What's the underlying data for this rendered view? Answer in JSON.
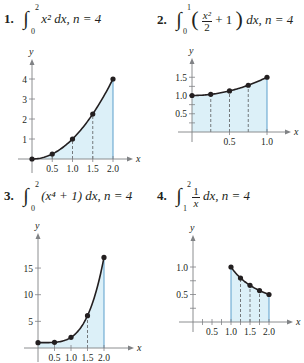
{
  "colors": {
    "fill": "#dcf0f8",
    "edge": "#5a9fcc",
    "curve": "#231f20",
    "axis": "#808285",
    "dash": "#58595b"
  },
  "problems": [
    {
      "number": "1.",
      "integral_lower": "0",
      "integral_upper": "2",
      "integrand": "x² dx,",
      "n_label": "n = 4"
    },
    {
      "number": "2.",
      "integral_lower": "0",
      "integral_upper": "1",
      "frac_top": "x²",
      "frac_bottom": "2",
      "integrand_rest": "+ 1",
      "dx": "dx,",
      "n_label": "n = 4"
    },
    {
      "number": "3.",
      "integral_lower": "0",
      "integral_upper": "2",
      "integrand": "(x⁴ + 1) dx,",
      "n_label": "n = 4"
    },
    {
      "number": "4.",
      "integral_lower": "1",
      "integral_upper": "2",
      "frac_top": "1",
      "frac_bottom": "x",
      "dx": "dx,",
      "n_label": "n = 4"
    }
  ],
  "chart_data": [
    {
      "type": "area",
      "title": "∫₀² x² dx, n = 4",
      "function": "x^2",
      "xlabel": "x",
      "ylabel": "y",
      "xlim": [
        0,
        2
      ],
      "ylim": [
        0,
        4
      ],
      "xticks": [
        0.5,
        1.0,
        1.5,
        2.0
      ],
      "xtick_labels": [
        "0.5",
        "1.0",
        "1.5",
        "2.0"
      ],
      "yticks": [
        1,
        2,
        3,
        4
      ],
      "ytick_labels": [
        "1",
        "2",
        "3",
        "4"
      ],
      "points": [
        [
          0,
          0
        ],
        [
          0.5,
          0.25
        ],
        [
          1.0,
          1.0
        ],
        [
          1.5,
          2.25
        ],
        [
          2.0,
          4.0
        ]
      ],
      "shaded_interval": [
        0,
        2
      ],
      "dashed_x": [
        0.5,
        1.0,
        1.5
      ],
      "layout": {
        "ox": 32,
        "oy": 159,
        "xu": 40.5,
        "yu": 20,
        "xmax_px": 128,
        "ytop_px": 64
      }
    },
    {
      "type": "area",
      "title": "∫₀¹ (x²/2 + 1) dx, n = 4",
      "function": "x^2/2 + 1",
      "xlabel": "x",
      "ylabel": "y",
      "xlim": [
        0,
        1
      ],
      "ylim": [
        0,
        1.5
      ],
      "xticks": [
        0.5,
        1.0
      ],
      "xtick_labels": [
        "0.5",
        "1.0"
      ],
      "yticks": [
        0.25,
        0.5,
        0.75,
        1.0,
        1.25,
        1.5
      ],
      "ytick_labels": [
        "",
        "0.5",
        "",
        "1.0",
        "",
        "1.5"
      ],
      "points": [
        [
          0,
          1.0
        ],
        [
          0.25,
          1.03125
        ],
        [
          0.5,
          1.125
        ],
        [
          0.75,
          1.28125
        ],
        [
          1.0,
          1.5
        ]
      ],
      "shaded_interval": [
        0,
        1
      ],
      "dashed_x": [
        0.25,
        0.5,
        0.75
      ],
      "layout": {
        "ox": 192,
        "oy": 132,
        "xu": 75,
        "yu": 36.5,
        "xmax_px": 286,
        "ytop_px": 63
      }
    },
    {
      "type": "area",
      "title": "∫₀² (x⁴ + 1) dx, n = 4",
      "function": "x^4 + 1",
      "xlabel": "x",
      "ylabel": "y",
      "xlim": [
        0,
        2
      ],
      "ylim": [
        0,
        17
      ],
      "xticks": [
        0.5,
        1.0,
        1.5,
        2.0
      ],
      "xtick_labels": [
        "0.5",
        "1.0",
        "1.5",
        "2.0"
      ],
      "yticks": [
        5,
        10,
        15
      ],
      "ytick_labels": [
        "5",
        "10",
        "15"
      ],
      "points": [
        [
          0,
          1.0
        ],
        [
          0.5,
          1.0625
        ],
        [
          1.0,
          2.0
        ],
        [
          1.5,
          6.0625
        ],
        [
          2.0,
          17.0
        ]
      ],
      "shaded_interval": [
        0,
        2
      ],
      "dashed_x": [
        1.5
      ],
      "layout": {
        "ox": 38,
        "oy": 348,
        "xu": 33,
        "yu": 5.33,
        "xmax_px": 129,
        "ytop_px": 238
      }
    },
    {
      "type": "area",
      "title": "∫₁² 1/x dx, n = 4",
      "function": "1/x",
      "xlabel": "x",
      "ylabel": "y",
      "xlim": [
        1,
        2
      ],
      "ylim": [
        0,
        1.0
      ],
      "xticks": [
        0.25,
        0.5,
        0.75,
        1.0,
        1.25,
        1.5,
        1.75,
        2.0
      ],
      "xtick_labels": [
        "",
        "0.5",
        "",
        "1.0",
        "",
        "1.5",
        "",
        "2.0"
      ],
      "yticks": [
        0.25,
        0.5,
        0.75,
        1.0
      ],
      "ytick_labels": [
        "",
        "0.5",
        "",
        "1.0"
      ],
      "points": [
        [
          1.0,
          1.0
        ],
        [
          1.25,
          0.8
        ],
        [
          1.5,
          0.667
        ],
        [
          1.75,
          0.571
        ],
        [
          2.0,
          0.5
        ]
      ],
      "shaded_interval": [
        1,
        2
      ],
      "dashed_x": [
        1.25,
        1.5,
        1.75
      ],
      "layout": {
        "ox": 193,
        "oy": 322,
        "xu": 38,
        "yu": 55,
        "xmax_px": 288,
        "ytop_px": 240
      }
    }
  ]
}
